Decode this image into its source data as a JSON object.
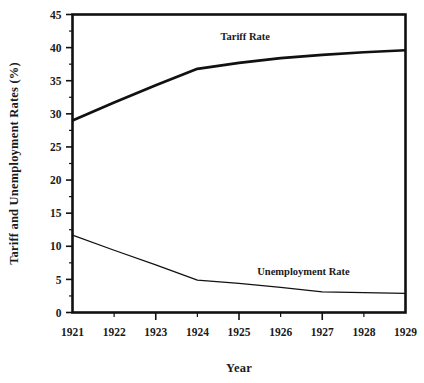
{
  "chart_data": {
    "type": "line",
    "title": "",
    "xlabel": "Year",
    "ylabel": "Tariff and Unemployment Rates (%)",
    "x": [
      1921,
      1922,
      1923,
      1924,
      1925,
      1926,
      1927,
      1928,
      1929
    ],
    "xtick_labels": [
      "1921",
      "1922",
      "1923",
      "1924",
      "1925",
      "1926",
      "1927",
      "1928",
      "1929"
    ],
    "ytick_labels": [
      "0",
      "5",
      "10",
      "15",
      "20",
      "25",
      "30",
      "35",
      "40",
      "45"
    ],
    "ytick_values": [
      0,
      5,
      10,
      15,
      20,
      25,
      30,
      35,
      40,
      45
    ],
    "minor_ytick_step": 2.5,
    "xlim": [
      1921,
      1929
    ],
    "ylim": [
      0,
      45
    ],
    "grid": false,
    "legend_position": "inline-labels",
    "series": [
      {
        "name": "Tariff Rate",
        "label": "Tariff Rate",
        "label_x": 1925.15,
        "label_y": 41.2,
        "linewidth": "thick",
        "color": "#111111",
        "values": [
          29.0,
          31.7,
          34.3,
          36.8,
          37.7,
          38.4,
          38.9,
          39.3,
          39.6
        ]
      },
      {
        "name": "Unemployment Rate",
        "label": "Unemployment Rate",
        "label_x": 1926.55,
        "label_y": 5.6,
        "linewidth": "thin",
        "color": "#111111",
        "values": [
          11.7,
          9.4,
          7.2,
          4.9,
          4.4,
          3.8,
          3.1,
          3.0,
          2.9
        ]
      }
    ]
  }
}
